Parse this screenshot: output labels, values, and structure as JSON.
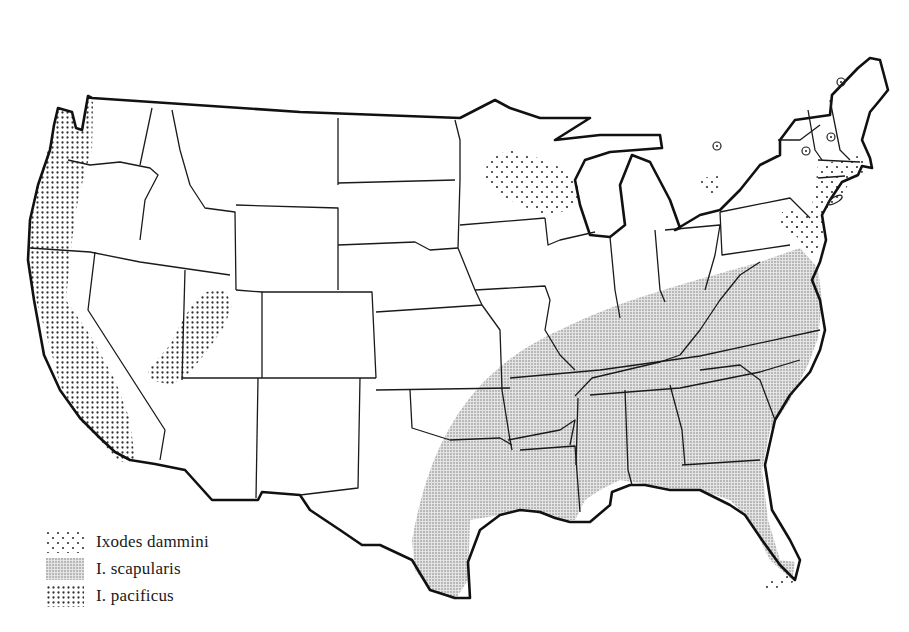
{
  "figure": {
    "type": "map"
  },
  "legend": {
    "items": [
      {
        "label": "Ixodes dammini",
        "pattern": "sparse-dots"
      },
      {
        "label": "I. scapularis",
        "pattern": "fine-stipple"
      },
      {
        "label": "I. pacificus",
        "pattern": "dense-dot-grid"
      }
    ]
  },
  "regions": {
    "pacificus": [
      "Pacific coast (Washington, Oregon, California)",
      "Western Utah / eastern Nevada patch"
    ],
    "scapularis": [
      "Southeastern United States from eastern Texas to Virginia and Florida"
    ],
    "dammini": [
      "Wisconsin / Minnesota",
      "Northeastern coast (Massachusetts, Connecticut, Rhode Island, New Jersey, Delaware)",
      "Scattered sites in Pennsylvania, New York"
    ]
  },
  "markers": {
    "circle_symbols": 5
  },
  "colors": {
    "line": "#1a1a1a",
    "background": "#ffffff",
    "stipple": "#555555"
  }
}
